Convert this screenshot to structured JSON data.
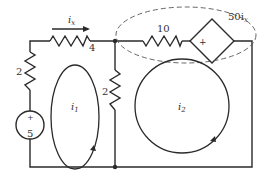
{
  "diagram": {
    "type": "circuit",
    "components": {
      "resistor_top_left": {
        "label": "4",
        "unit": "ohm"
      },
      "resistor_left": {
        "label": "2",
        "unit": "ohm"
      },
      "resistor_middle": {
        "label": "2",
        "unit": "ohm"
      },
      "resistor_top_right": {
        "label": "10",
        "unit": "ohm"
      },
      "voltage_source": {
        "label": "5",
        "polarity": "+"
      },
      "dependent_source": {
        "label_main": "50i",
        "label_sub": "x",
        "polarity": "+"
      }
    },
    "current_label": {
      "main": "i",
      "sub": "x"
    },
    "loops": [
      {
        "main": "i",
        "sub": "1"
      },
      {
        "main": "i",
        "sub": "2"
      }
    ],
    "colors": {
      "line": "#2a2a2a",
      "background": "#ffffff"
    }
  }
}
